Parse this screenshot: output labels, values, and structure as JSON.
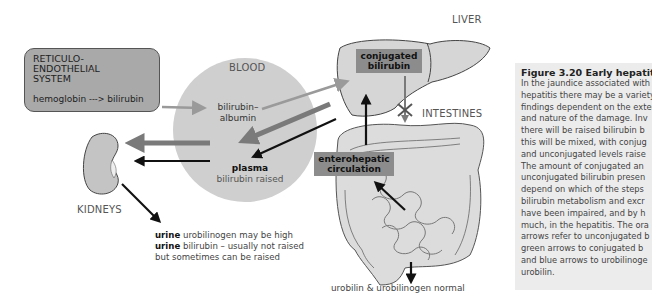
{
  "diagram": {
    "reticulo_box": {
      "title_lines": [
        "RETICULO-",
        "ENDOTHELIAL",
        "SYSTEM"
      ],
      "flow_from": "hemoglobin",
      "flow_arrow": "--->",
      "flow_to": "bilirubin"
    },
    "blood": {
      "label": "BLOOD",
      "albumin_line1": "bilirubin–",
      "albumin_line2": "albumin",
      "plasma_bold": "plasma",
      "plasma_rest": "bilirubin raised"
    },
    "liver": {
      "label": "LIVER",
      "box_line1": "conjugated",
      "box_line2": "bilirubin"
    },
    "intestines": {
      "label": "INTESTINES",
      "entero_line1": "enterohepatic",
      "entero_line2": "circulation",
      "bottom_note": "urobilin & urobilinogen normal"
    },
    "kidneys": {
      "label": "KIDNEYS",
      "urine_line1_bold": "urine",
      "urine_line1_rest": " urobilinogen may be high",
      "urine_line2_bold": "urine",
      "urine_line2_rest": " bilirubin – usually not raised",
      "urine_line3": "but sometimes can be raised"
    },
    "colors": {
      "unconjugated_arrow": "#999999",
      "conjugated_arrow": "#777777",
      "urobilinogen_arrow": "#111111",
      "blood_circle": "#cfcfcf",
      "organ_fill": "#d9d9d9"
    }
  },
  "caption": {
    "title": "Figure 3.20 Early hepatitis.",
    "lines": [
      "In the jaundice associated with",
      "hepatitis there may be a variety of",
      "findings dependent on the extent",
      "and nature of the damage. Inv",
      "there will be raised bilirubin b",
      "this will be mixed, with conjug",
      "and unconjugated levels raise",
      "The amount of conjugated an",
      "unconjugated bilirubin presen",
      "depend on which of the steps",
      "bilirubin metabolism and excr",
      "have been impaired, and by h",
      "much, in the hepatitis. The ora",
      "arrows refer to unconjugated b",
      "green arrows to conjugated b",
      "and blue arrows to urobilinoge",
      "urobilin."
    ]
  }
}
